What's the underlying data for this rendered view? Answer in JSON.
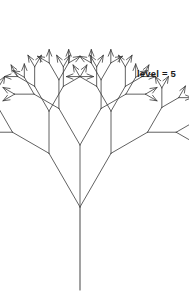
{
  "figure": {
    "title": "",
    "label": "level = 5",
    "label_position": {
      "x": 137,
      "y": 68
    },
    "background_color": "#ffffff",
    "stroke_color": "#3a3a3a",
    "trunk_color": "#555555",
    "canvas": {
      "width": 189,
      "height": 299
    }
  },
  "chart_data": {
    "type": "diagram",
    "diagram_kind": "recursive-fractal-tree",
    "title": "",
    "annotations": [
      "level = 5"
    ],
    "recursion_level": 5,
    "branch_angle_degrees": 30,
    "branch_length_ratio": 0.68,
    "trunk": {
      "base": {
        "x": 80,
        "y": 290
      },
      "top": {
        "x": 80,
        "y": 207
      },
      "length": 83,
      "color": "#555555",
      "width": 1.1
    },
    "root_branch_point": {
      "x": 80,
      "y": 207
    },
    "first_branch_length": 62,
    "arrow_tips": true,
    "arrow_head_length": 7,
    "arrow_head_angle_degrees": 22,
    "bounds": {
      "x_min": 12,
      "x_max": 145,
      "y_min": 16,
      "y_max": 290
    },
    "symmetry": "bilateral-vertical",
    "stroke_width": 0.8,
    "xlabel": "",
    "ylabel": "",
    "grid": false,
    "legend": false
  }
}
